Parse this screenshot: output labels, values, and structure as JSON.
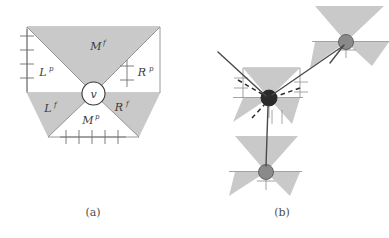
{
  "figure": {
    "title": "",
    "panels": [
      {
        "id": "a",
        "caption": "(a)",
        "description": "Single vertex v with four shaded cone regions labeled by predecessor/follower sets",
        "vertex_label": "v",
        "region_labels": [
          {
            "name": "M-follower",
            "base": "M",
            "sup": "f",
            "x": 96,
            "y": 50
          },
          {
            "name": "L-predecessor",
            "base": "L",
            "sup": "p",
            "x": 43,
            "y": 76
          },
          {
            "name": "R-predecessor",
            "base": "R",
            "sup": "p",
            "x": 142,
            "y": 76
          },
          {
            "name": "L-follower",
            "base": "L",
            "sup": "f",
            "x": 48,
            "y": 112
          },
          {
            "name": "M-predecessor",
            "base": "M",
            "sup": "p",
            "x": 88,
            "y": 124
          },
          {
            "name": "R-follower",
            "base": "R",
            "sup": "f",
            "x": 119,
            "y": 111
          }
        ],
        "tick_counts": {
          "left": 4,
          "right": 2,
          "bottom": 5
        }
      },
      {
        "id": "b",
        "caption": "(b)",
        "description": "Three vertex gadgets connected by solid and dashed edges forming a path",
        "nodes": [
          {
            "name": "center-node",
            "style": "filled-dark",
            "cx": 269,
            "cy": 98
          },
          {
            "name": "upper-right-node",
            "style": "filled-gray",
            "cx": 346,
            "cy": 42
          },
          {
            "name": "lower-node",
            "style": "filled-gray",
            "cx": 266,
            "cy": 172
          }
        ],
        "edges": [
          {
            "name": "incoming-solid-edge",
            "style": "solid"
          },
          {
            "name": "upper-right-solid-edge",
            "style": "solid"
          },
          {
            "name": "lower-solid-edge",
            "style": "solid"
          },
          {
            "name": "left-dashed-edge",
            "style": "dashed"
          },
          {
            "name": "right-dashed-edge",
            "style": "dashed"
          },
          {
            "name": "down-dashed-edge",
            "style": "dashed"
          }
        ]
      }
    ]
  },
  "colors": {
    "cone_fill": "#c9c9c9",
    "cone_fill_light": "#d2d2d2",
    "outline": "#8c8c8c",
    "node_dark": "#2b2b2b",
    "node_gray": "#8a8a8a",
    "text": "#3a3a3a",
    "caption": "#4d4d4d",
    "background": "#ffffff"
  }
}
